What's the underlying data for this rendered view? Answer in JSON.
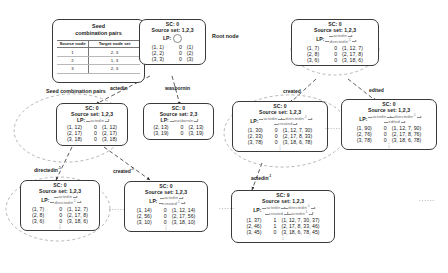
{
  "figure": {
    "title_caption": "Seed combination pairs",
    "root_label": "Root node"
  },
  "seed_table": {
    "title_line1": "Seed",
    "title_line2": "combination pairs",
    "headers": [
      "Source node",
      "Target node set"
    ],
    "rows": [
      {
        "source": "1",
        "targets": "2, 3"
      },
      {
        "source": "2",
        "targets": "1, 3"
      },
      {
        "source": "3",
        "targets": "2, 3"
      }
    ]
  },
  "edge_labels": [
    {
      "id": "e-actedin-root",
      "text": "actedin"
    },
    {
      "id": "e-wasbornin-root",
      "text": "wasbornin"
    },
    {
      "id": "e-directedin",
      "text": "directedin",
      "sup": "-1"
    },
    {
      "id": "e-created-left",
      "text": "created",
      "sup": "-1"
    },
    {
      "id": "e-created-mid",
      "text": "created"
    },
    {
      "id": "e-edited",
      "text": "edited"
    },
    {
      "id": "e-actedin-bottom",
      "text": "actedin",
      "sup": "-1"
    }
  ],
  "nodes": [
    {
      "id": "root",
      "sc": "SC: 0",
      "source_set": "Source set: 1,2,3",
      "lp_label": "LP:",
      "lp_rels": [],
      "lp_empty_circle": true,
      "rows": [
        {
          "pair": "(1, 1)",
          "sc": "0",
          "path": "(1)"
        },
        {
          "pair": "(2, 2)",
          "sc": "0",
          "path": "(2)"
        },
        {
          "pair": "(3, 3)",
          "sc": "0",
          "path": "(3)"
        }
      ],
      "dots": false
    },
    {
      "id": "node-actedin",
      "sc": "SC: 0",
      "source_set": "Source set: 1,2,3",
      "lp_label": "LP:",
      "lp_rels": [
        [
          {
            "text": "actedin",
            "sup": ""
          }
        ]
      ],
      "lp_empty_circle": false,
      "rows": [
        {
          "pair": "(1, 12)",
          "sc": "0",
          "path": "(1, 12)"
        },
        {
          "pair": "(2, 17)",
          "sc": "0",
          "path": "(2, 17)"
        },
        {
          "pair": "(3, 18)",
          "sc": "0",
          "path": "(3, 18)"
        }
      ],
      "dots": false
    },
    {
      "id": "node-wasbornin",
      "sc": "SC: 0",
      "source_set": "Source set: 2,3",
      "lp_label": "LP:",
      "lp_rels": [
        [
          {
            "text": "wasbornin",
            "sup": ""
          }
        ]
      ],
      "lp_empty_circle": false,
      "rows": [
        {
          "pair": "(2, 13)",
          "sc": "0",
          "path": "(2, 13)"
        },
        {
          "pair": "(3, 19)",
          "sc": "0",
          "path": "(3, 19)"
        }
      ],
      "dots": false
    },
    {
      "id": "node-created-mid",
      "sc": "SC: 0",
      "source_set": "Source set: 1,2,3",
      "lp_label": "LP:",
      "lp_rels": [
        [
          {
            "text": "actedin",
            "sup": ""
          },
          {
            "text": "directedin",
            "sup": "-1"
          }
        ],
        [
          {
            "text": "created",
            "sup": ""
          }
        ]
      ],
      "lp_empty_circle": false,
      "rows": [
        {
          "pair": "(1, 30)",
          "sc": "0",
          "path": "(1, 12, 7, 30)"
        },
        {
          "pair": "(2, 33)",
          "sc": "0",
          "path": "(2, 17, 8, 33)"
        },
        {
          "pair": "(3, 78)",
          "sc": "0",
          "path": "(3, 18, 6, 78)"
        }
      ],
      "dots": true
    },
    {
      "id": "node-edited",
      "sc": "SC: 0",
      "source_set": "Source set: 1,2,3",
      "lp_label": "LP:",
      "lp_rels": [
        [
          {
            "text": "actedin",
            "sup": ""
          },
          {
            "text": "directedin",
            "sup": "-1"
          }
        ],
        [
          {
            "text": "edited",
            "sup": ""
          }
        ]
      ],
      "lp_empty_circle": false,
      "rows": [
        {
          "pair": "(1, 90)",
          "sc": "0",
          "path": "(1, 12, 7, 90)"
        },
        {
          "pair": "(2, 76)",
          "sc": "0",
          "path": "(2, 17, 8, 76)"
        },
        {
          "pair": "(3, 78)",
          "sc": "0",
          "path": "(3, 18, 6, 78)"
        }
      ],
      "dots": true
    },
    {
      "id": "node-top-right",
      "sc": "SC: 0",
      "source_set": "Source set: 1,2,3",
      "lp_label": "LP:",
      "lp_rels": [
        [
          {
            "text": "actedin",
            "sup": ""
          }
        ],
        [
          {
            "text": "directedin",
            "sup": "-1"
          }
        ]
      ],
      "lp_empty_circle": false,
      "rows": [
        {
          "pair": "(1, 7)",
          "sc": "0",
          "path": "(1, 12, 7)"
        },
        {
          "pair": "(2, 8)",
          "sc": "0",
          "path": "(2, 17, 8)"
        },
        {
          "pair": "(3, 6)",
          "sc": "0",
          "path": "(3, 18, 6)"
        }
      ],
      "dots": false
    },
    {
      "id": "node-directedin",
      "sc": "SC: 0",
      "source_set": "Source set: 1,2,3",
      "lp_label": "LP:",
      "lp_rels": [
        [
          {
            "text": "actedin",
            "sup": ""
          }
        ],
        [
          {
            "text": "directedin",
            "sup": "-1"
          }
        ]
      ],
      "lp_empty_circle": false,
      "rows": [
        {
          "pair": "(1, 7)",
          "sc": "0",
          "path": "(1, 12, 7)"
        },
        {
          "pair": "(2, 8)",
          "sc": "0",
          "path": "(2, 17, 8)"
        },
        {
          "pair": "(3, 6)",
          "sc": "0",
          "path": "(3, 18, 6)"
        }
      ],
      "dots": true
    },
    {
      "id": "node-created-left",
      "sc": "SC: 0",
      "source_set": "Source set: 1,2,3",
      "lp_label": "LP:",
      "lp_rels": [
        [
          {
            "text": "actedin",
            "sup": ""
          }
        ],
        [
          {
            "text": "created",
            "sup": "-1"
          }
        ]
      ],
      "lp_empty_circle": false,
      "rows": [
        {
          "pair": "(1, 14)",
          "sc": "0",
          "path": "(1, 12, 14)"
        },
        {
          "pair": "(2, 56)",
          "sc": "0",
          "path": "(2, 17, 56)"
        },
        {
          "pair": "(3, 10)",
          "sc": "0",
          "path": "(3, 18, 10)"
        }
      ],
      "dots": true
    },
    {
      "id": "node-sc9",
      "sc": "SC: 9",
      "source_set": "Source set: 1,2,3",
      "lp_label": "LP:",
      "lp_rels": [
        [
          {
            "text": "actedin",
            "sup": ""
          },
          {
            "text": "directedin",
            "sup": "-1"
          }
        ],
        [
          {
            "text": "created",
            "sup": ""
          },
          {
            "text": "actedin",
            "sup": "-1"
          }
        ]
      ],
      "lp_empty_circle": false,
      "rows": [
        {
          "pair": "(1, 37)",
          "sc": "1",
          "path": "(1, 12, 7, 30, 37)"
        },
        {
          "pair": "(2, 46)",
          "sc": "1",
          "path": "(2, 17, 8, 33, 46)"
        },
        {
          "pair": "(3, 45)",
          "sc": "0",
          "path": "(3, 18, 6, 78, 45)"
        }
      ],
      "dots": true
    }
  ],
  "ellipses": [
    "......",
    "......",
    "......",
    "......"
  ]
}
